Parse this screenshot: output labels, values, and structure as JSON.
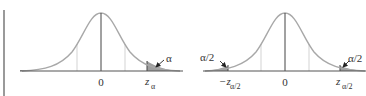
{
  "figures": [
    {
      "id": "one-tailed",
      "center_label": "0",
      "critical_label": "z",
      "critical_subscript": "α",
      "area_label": "α"
    },
    {
      "id": "two-tailed",
      "center_label": "0",
      "left_critical_label": "−z",
      "left_critical_subscript": "α/2",
      "right_critical_label": "z",
      "right_critical_subscript": "α/2",
      "left_area_label": "α/2",
      "right_area_label": "α/2"
    }
  ],
  "colors": {
    "curve": "#a8a8a8",
    "axis": "#555555",
    "shade": "#9e9e9e",
    "gridline": "#c8c8c8",
    "text": "#333333"
  }
}
